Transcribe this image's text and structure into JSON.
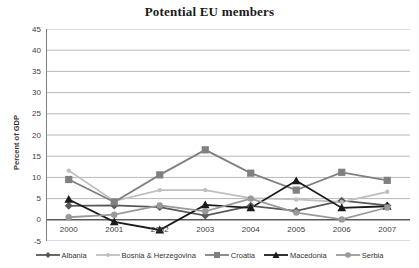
{
  "title": "Potential EU members",
  "y_axis_title": "Percent of GDP",
  "chart_data": {
    "type": "line",
    "title": "Potential EU members",
    "xlabel": "",
    "ylabel": "Percent of GDP",
    "categories": [
      "2000",
      "2001",
      "2002",
      "2003",
      "2004",
      "2005",
      "2006",
      "2007"
    ],
    "ylim": [
      -5,
      45
    ],
    "ytick_step": 5,
    "grid": true,
    "zero_axis_emphasized": true,
    "legend_position": "bottom",
    "series": [
      {
        "name": "Albania",
        "marker": "diamond",
        "color": "#595959",
        "values": [
          3.3,
          3.4,
          3.0,
          1.0,
          3.3,
          2.1,
          4.5,
          3.4
        ]
      },
      {
        "name": "Bosnia & Herzegovina",
        "marker": "circle-small",
        "color": "#bfbfbf",
        "values": [
          11.6,
          4.4,
          7.0,
          7.0,
          5.1,
          4.8,
          4.2,
          6.6
        ]
      },
      {
        "name": "Croatia",
        "marker": "square",
        "color": "#808080",
        "values": [
          9.5,
          4.2,
          10.6,
          16.5,
          11.0,
          7.0,
          11.2,
          9.3
        ]
      },
      {
        "name": "Macedonia",
        "marker": "triangle",
        "color": "#1a1a1a",
        "values": [
          4.8,
          -0.5,
          -2.4,
          3.5,
          2.8,
          9.2,
          2.8,
          3.2
        ]
      },
      {
        "name": "Serbia",
        "marker": "circle",
        "color": "#999999",
        "values": [
          0.6,
          1.2,
          3.4,
          2.0,
          5.0,
          1.7,
          0.1,
          2.9
        ]
      }
    ],
    "style": {
      "gridline_color": "#b8b8b8",
      "zero_axis_color": "#595959",
      "left_axis_color": "#808080",
      "background": "#ffffff"
    }
  }
}
